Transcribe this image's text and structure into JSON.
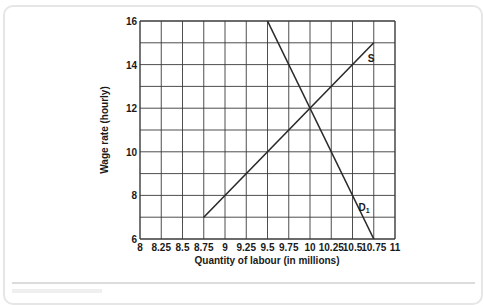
{
  "chart_data": {
    "type": "line",
    "title": "",
    "xlabel": "Quantity of labour (in millions)",
    "ylabel": "Wage rate (hourly)",
    "xlim": [
      8,
      11
    ],
    "ylim": [
      6,
      16
    ],
    "x_ticks": [
      "8",
      "8.25",
      "8.5",
      "8.75",
      "9",
      "9.25",
      "9.5",
      "9.75",
      "10",
      "10.25",
      "10.5",
      "10.75",
      "11"
    ],
    "y_ticks": [
      "6",
      "8",
      "10",
      "12",
      "14",
      "16"
    ],
    "grid": true,
    "grid_x_step": 0.25,
    "grid_y_step": 1,
    "series": [
      {
        "name": "S",
        "label": "S",
        "points": [
          [
            8.75,
            7
          ],
          [
            10.75,
            15
          ]
        ]
      },
      {
        "name": "D1",
        "label": "D",
        "label_sub": "1",
        "points": [
          [
            9.5,
            16
          ],
          [
            10.75,
            6
          ]
        ]
      }
    ],
    "equilibrium": {
      "x": 10,
      "y": 12
    }
  },
  "colors": {
    "line": "#2a2a2a",
    "grid": "#3a3a3a",
    "frame": "#e6e6e6"
  }
}
